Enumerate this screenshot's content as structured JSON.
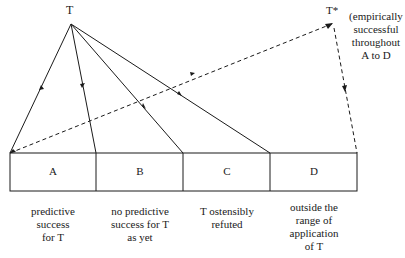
{
  "diagram": {
    "theory_label": "T",
    "successor_label": "T*",
    "successor_note": [
      "(empirically",
      "successful",
      "throughout",
      "A to D"
    ],
    "regions": [
      {
        "letter": "A",
        "caption": [
          "predictive",
          "success",
          "for T"
        ]
      },
      {
        "letter": "B",
        "caption": [
          "no predictive",
          "success for T",
          "as yet"
        ]
      },
      {
        "letter": "C",
        "caption": [
          "T ostensibly",
          "refuted"
        ]
      },
      {
        "letter": "D",
        "caption": [
          "outside the",
          "range of",
          "application",
          "of T"
        ]
      }
    ]
  }
}
